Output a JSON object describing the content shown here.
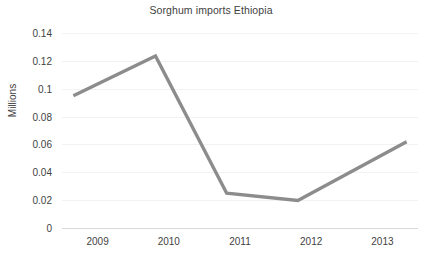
{
  "chart_data": {
    "type": "line",
    "title": "Sorghum imports Ethiopia",
    "xlabel": "",
    "ylabel": "Millions",
    "categories": [
      "2009",
      "2010",
      "2011",
      "2012",
      "2013"
    ],
    "values": [
      0.095,
      0.1235,
      0.025,
      0.0198,
      0.062
    ],
    "series": [
      {
        "name": "Sorghum imports Ethiopia",
        "values": [
          0.095,
          0.1235,
          0.025,
          0.0198,
          0.062
        ]
      }
    ],
    "ylim": [
      0,
      0.14
    ],
    "yticks": [
      0,
      0.02,
      0.04,
      0.06,
      0.08,
      0.1,
      0.12,
      0.14
    ],
    "ytick_labels": [
      "0",
      "0.02",
      "0.04",
      "0.06",
      "0.08",
      "0.1",
      "0.12",
      "0.14"
    ],
    "grid": true,
    "legend": false,
    "legend_position": "none",
    "line_color": "#8c8c8c",
    "gridline_color": "#f2f2f2",
    "axis_color": "#d9d9d9",
    "text_color": "#3f3f3f",
    "background_color": "#ffffff"
  }
}
